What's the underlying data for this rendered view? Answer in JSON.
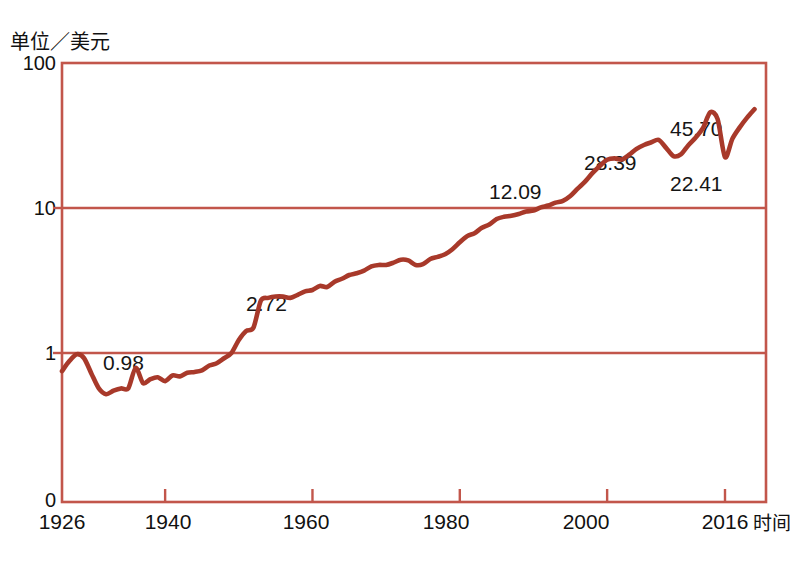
{
  "chart_data": {
    "type": "line",
    "title": "",
    "ylabel": "单位／美元",
    "xlabel": "时间",
    "yscale": "log",
    "grid": true,
    "legend": "none",
    "yticks": [
      "100",
      "10",
      "1",
      "0"
    ],
    "ytick_values": [
      100,
      10,
      1,
      0
    ],
    "xticks": [
      "1926",
      "1940",
      "1960",
      "1980",
      "2000",
      "2016"
    ],
    "xtick_values": [
      1926,
      1940,
      1960,
      1980,
      2000,
      2016
    ],
    "xlim": [
      1926,
      2021
    ],
    "ylim": [
      0.3,
      100
    ],
    "annotations": [
      {
        "label": "0.98",
        "x": 1928,
        "y": 0.98
      },
      {
        "label": "2.72",
        "x": 1952,
        "y": 2.72
      },
      {
        "label": "12.09",
        "x": 1994,
        "y": 12.09
      },
      {
        "label": "28.39",
        "x": 2006,
        "y": 28.39
      },
      {
        "label": "45.70",
        "x": 2014,
        "y": 45.7
      },
      {
        "label": "22.41",
        "x": 2016,
        "y": 22.41
      }
    ],
    "series": [
      {
        "name": "index",
        "color": "#A8392A",
        "x": [
          1926,
          1927,
          1928,
          1929,
          1930,
          1931,
          1932,
          1933,
          1934,
          1935,
          1936,
          1937,
          1938,
          1939,
          1940,
          1941,
          1942,
          1943,
          1944,
          1945,
          1946,
          1947,
          1948,
          1949,
          1950,
          1951,
          1952,
          1953,
          1954,
          1955,
          1956,
          1957,
          1958,
          1959,
          1960,
          1961,
          1962,
          1963,
          1964,
          1965,
          1966,
          1967,
          1968,
          1969,
          1970,
          1971,
          1972,
          1973,
          1974,
          1975,
          1976,
          1977,
          1978,
          1979,
          1980,
          1981,
          1982,
          1983,
          1984,
          1985,
          1986,
          1987,
          1988,
          1989,
          1990,
          1991,
          1992,
          1993,
          1994,
          1995,
          1996,
          1997,
          1998,
          1999,
          2000,
          2001,
          2002,
          2003,
          2004,
          2005,
          2006,
          2007,
          2008,
          2009,
          2010,
          2011,
          2012,
          2013,
          2014,
          2015,
          2016,
          2017,
          2018,
          2019,
          2020
        ],
        "y": [
          0.75,
          0.88,
          0.98,
          0.92,
          0.72,
          0.57,
          0.52,
          0.55,
          0.57,
          0.57,
          0.79,
          0.62,
          0.66,
          0.68,
          0.64,
          0.7,
          0.69,
          0.73,
          0.74,
          0.76,
          0.82,
          0.85,
          0.92,
          1.0,
          1.23,
          1.42,
          1.5,
          2.3,
          2.4,
          2.45,
          2.45,
          2.4,
          2.52,
          2.66,
          2.72,
          2.9,
          2.85,
          3.1,
          3.25,
          3.45,
          3.55,
          3.7,
          3.96,
          4.05,
          4.05,
          4.2,
          4.4,
          4.35,
          4.05,
          4.1,
          4.45,
          4.6,
          4.8,
          5.2,
          5.8,
          6.4,
          6.7,
          7.3,
          7.7,
          8.4,
          8.7,
          8.85,
          9.1,
          9.45,
          9.6,
          10.1,
          10.4,
          10.9,
          11.2,
          12.09,
          13.6,
          15.2,
          17.4,
          19.5,
          21.5,
          22.0,
          21.6,
          23.3,
          25.6,
          27.2,
          28.39,
          29.5,
          26.0,
          22.8,
          23.4,
          27.0,
          30.5,
          35.5,
          45.7,
          41.0,
          22.41,
          30.0,
          36.0,
          42.0,
          48.0
        ]
      }
    ]
  },
  "axes": {
    "y_title": "单位／美元",
    "x_title": "时间",
    "y_labels": [
      "100",
      "10",
      "1",
      "0"
    ],
    "x_labels": [
      "1926",
      "1940",
      "1960",
      "1980",
      "2000",
      "2016"
    ]
  },
  "labels": {
    "p0": "0.98",
    "p1": "2.72",
    "p2": "12.09",
    "p3": "28.39",
    "p4": "45.70",
    "p5": "22.41"
  },
  "colors": {
    "line": "#A8392A",
    "grid": "#C2564B",
    "frame": "#C2564B",
    "text": "#151515",
    "background": "#FFFFFF"
  }
}
